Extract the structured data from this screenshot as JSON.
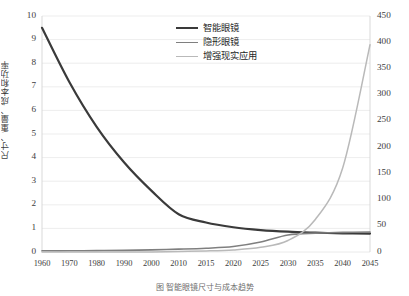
{
  "chart_data": {
    "type": "line",
    "title": "",
    "caption": "图   智能眼镜尺寸与成本趋势",
    "xlabel": "",
    "ylabel": "尺寸、重量、成本和功率",
    "ylabel_right": "",
    "x": [
      1960,
      1970,
      1980,
      1990,
      2000,
      2010,
      2015,
      2020,
      2025,
      2030,
      2035,
      2040,
      2045
    ],
    "xticklabels": [
      "1960",
      "1970",
      "1980",
      "1990",
      "2000",
      "2010",
      "2015",
      "2020",
      "2025",
      "2030",
      "2035",
      "2040",
      "2045"
    ],
    "ylim": [
      0,
      10
    ],
    "yticks": [
      0,
      1,
      2,
      3,
      4,
      5,
      6,
      7,
      8,
      9,
      10
    ],
    "yticklabels": [
      "0",
      "1",
      "2",
      "3",
      "4",
      "5",
      "6",
      "7",
      "8",
      "9",
      "10"
    ],
    "ylim_right": [
      0,
      450
    ],
    "yticks_right": [
      0,
      50,
      100,
      150,
      200,
      250,
      300,
      350,
      400,
      450
    ],
    "yticklabels_right": [
      "0",
      "50",
      "100",
      "150",
      "200",
      "250",
      "300",
      "350",
      "400",
      "450"
    ],
    "grid": true,
    "grid_axis": "y",
    "legend_position": "upper-center",
    "series": [
      {
        "name": "智能眼镜",
        "axis": "left",
        "color": "#3a3a3a",
        "width": 2.2,
        "values": [
          9.5,
          7.2,
          5.3,
          3.8,
          2.6,
          1.6,
          1.25,
          1.05,
          0.93,
          0.86,
          0.82,
          0.79,
          0.78
        ]
      },
      {
        "name": "隐形眼镜",
        "axis": "left",
        "color": "#7f7f7f",
        "width": 1.6,
        "values": [
          0.05,
          0.05,
          0.06,
          0.07,
          0.09,
          0.12,
          0.16,
          0.23,
          0.42,
          0.72,
          0.8,
          0.83,
          0.85
        ]
      },
      {
        "name": "增强现实应用",
        "axis": "right",
        "color": "#b9b9b9",
        "width": 1.5,
        "values": [
          0,
          0,
          0,
          0,
          0,
          1,
          2,
          4,
          9,
          22,
          62,
          160,
          395
        ]
      }
    ]
  }
}
